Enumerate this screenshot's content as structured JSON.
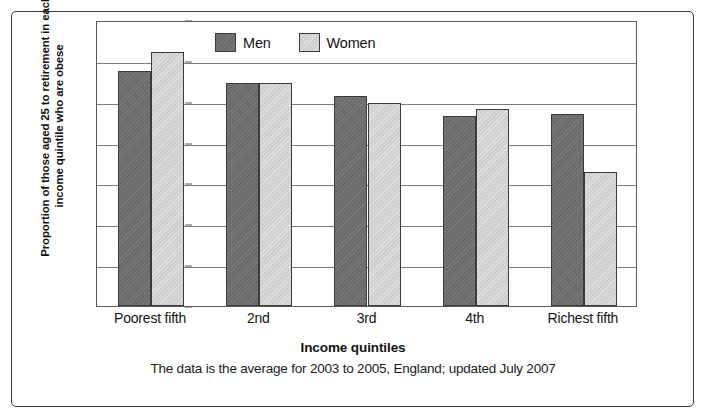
{
  "chart_data": {
    "type": "bar",
    "title": "",
    "subtitle": "",
    "xlabel": "Income quintiles",
    "ylabel": "Proportion of those aged 25 to retirement in each income quintile who are obese",
    "caption": "The data is the average for 2003 to 2005, England; updated July 2007",
    "categories": [
      "Poorest fifth",
      "2nd",
      "3rd",
      "4th",
      "Richest fifth"
    ],
    "series": [
      {
        "name": "Men",
        "color": "#6b6b6b",
        "values": [
          28.7,
          27.3,
          25.7,
          23.3,
          23.5
        ]
      },
      {
        "name": "Women",
        "color": "#cfcfcf",
        "values": [
          31.1,
          27.3,
          24.8,
          24.1,
          16.4
        ]
      }
    ],
    "ylim": [
      0,
      35
    ],
    "ytick_values": [
      0,
      5,
      10,
      15,
      20,
      25,
      30,
      35
    ],
    "ytick_labels": [
      "0%",
      "5%",
      "10%",
      "15%",
      "20%",
      "25%",
      "30%",
      "35%"
    ],
    "ytick_suffix": "%",
    "grid": true,
    "grid_axis": "y",
    "legend_position": "top-left-inside",
    "bar_group_gap": true
  }
}
